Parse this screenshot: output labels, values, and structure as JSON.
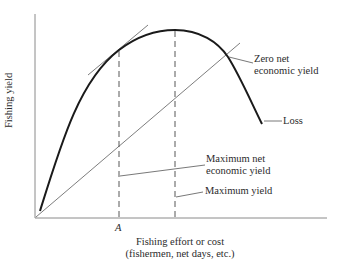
{
  "diagram": {
    "type": "economic yield curve",
    "axes": {
      "y_label": "Fishing yield",
      "x_label_line1": "Fishing effort or cost",
      "x_label_line2": "(fishermen, net days, etc.)",
      "x_tick_label": "A"
    },
    "annotations": {
      "zero_net_line1": "Zero net",
      "zero_net_line2": "economic yield",
      "loss": "Loss",
      "max_net_line1": "Maximum net",
      "max_net_line2": "economic yield",
      "max_yield": "Maximum yield"
    },
    "elements": [
      {
        "name": "yield-curve",
        "desc": "Thick concave curve rising from origin to a peak then falling"
      },
      {
        "name": "cost-line",
        "desc": "Thin straight line from origin (effort/cost)"
      },
      {
        "name": "tangent-line",
        "desc": "Thin line tangent to curve at point A, parallel to cost line"
      },
      {
        "name": "dashed-line-a",
        "desc": "Vertical dashed line at A (maximum net economic yield)"
      },
      {
        "name": "dashed-line-max",
        "desc": "Vertical dashed line at peak (maximum yield)"
      }
    ],
    "colors": {
      "curve": "#1a1a1a",
      "thin_lines": "#6e6e6e",
      "axes": "#8a8a8a",
      "text": "#2b2b2b"
    }
  }
}
